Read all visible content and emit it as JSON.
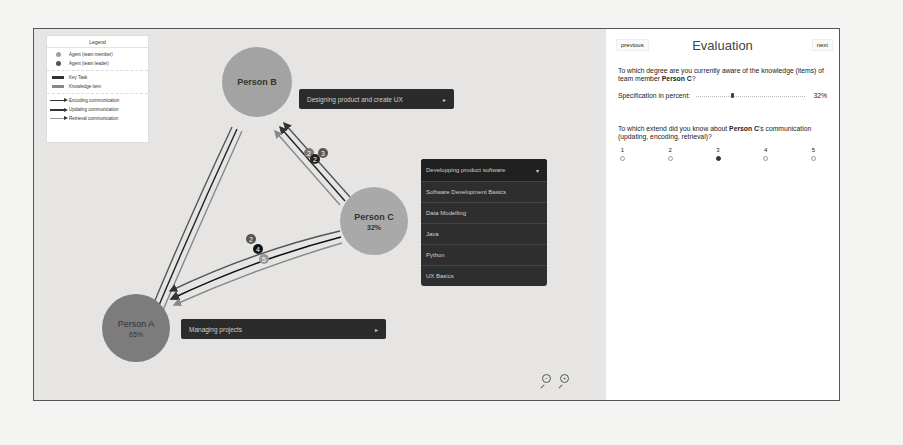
{
  "legend": {
    "title": "Legend",
    "agents": [
      {
        "label": "Agent (team member)",
        "color": "#a0a0a0"
      },
      {
        "label": "Agent (team leader)",
        "color": "#555555"
      }
    ],
    "items": [
      {
        "label": "Key Task"
      },
      {
        "label": "Knowledge item"
      }
    ],
    "communication": [
      {
        "label": "Encoding communication",
        "color": "#555555"
      },
      {
        "label": "Updating communication",
        "color": "#111111"
      },
      {
        "label": "Retrieval communication",
        "color": "#999999"
      }
    ]
  },
  "nodes": {
    "person_b": {
      "name": "Person B",
      "pct": "",
      "color": "#a3a3a3"
    },
    "person_c": {
      "name": "Person C",
      "pct": "32%",
      "color": "#a9a9a9"
    },
    "person_a": {
      "name": "Person A",
      "pct": "65%",
      "color": "#7c7c7c"
    }
  },
  "tasks": {
    "person_b": {
      "label": "Designing product and create UX",
      "arrow": "▸"
    },
    "person_a": {
      "label": "Managing projects",
      "arrow": "▸"
    }
  },
  "dropdown": {
    "header": "Developping product software",
    "caret": "▾",
    "items": [
      "Software Development Basics",
      "Data Modelling",
      "Java",
      "Python",
      "UX Basics"
    ]
  },
  "edge_badges": {
    "b_c": [
      "2",
      "2",
      "3"
    ],
    "a_c": [
      "2",
      "4",
      "5"
    ]
  },
  "zoom": {
    "zoom_out": "−",
    "zoom_in": "+"
  },
  "evaluation": {
    "previous": "previous",
    "title": "Evaluation",
    "next": "next",
    "q1_pre": "To which degree are you currently aware of the knowledge (items) of team member ",
    "q1_person": "Person C",
    "q1_post": "?",
    "slider_label": "Specification in percent:",
    "slider_value": "32%",
    "q2_pre": "To which extend did you know about ",
    "q2_person": "Person C",
    "q2_post": "'s communication (updating, encoding, retrieval)?",
    "scale": [
      "1",
      "2",
      "3",
      "4",
      "5"
    ],
    "selected": "3"
  }
}
